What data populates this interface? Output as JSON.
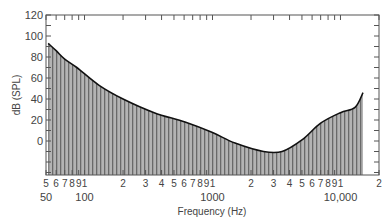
{
  "chart_data": {
    "type": "area",
    "title": "",
    "xlabel": "Frequency (Hz)",
    "ylabel": "dB (SPL)",
    "xscale": "log",
    "xlim": [
      50,
      20000
    ],
    "ylim": [
      -32,
      120
    ],
    "grid": false,
    "legend": null,
    "y_ticks": [
      0,
      20,
      40,
      60,
      80,
      100,
      120
    ],
    "y_minor_ticks": [
      -30,
      -20,
      -10,
      10,
      30,
      50,
      70,
      90,
      110
    ],
    "x_minor_tick_labels": [
      {
        "f": 50,
        "label": "5"
      },
      {
        "f": 60,
        "label": "6"
      },
      {
        "f": 70,
        "label": "7"
      },
      {
        "f": 80,
        "label": "8"
      },
      {
        "f": 90,
        "label": "9"
      },
      {
        "f": 100,
        "label": "1"
      },
      {
        "f": 200,
        "label": "2"
      },
      {
        "f": 300,
        "label": "3"
      },
      {
        "f": 400,
        "label": "4"
      },
      {
        "f": 500,
        "label": "5"
      },
      {
        "f": 600,
        "label": "6"
      },
      {
        "f": 700,
        "label": "7"
      },
      {
        "f": 800,
        "label": "8"
      },
      {
        "f": 900,
        "label": "9"
      },
      {
        "f": 1000,
        "label": "1"
      },
      {
        "f": 2000,
        "label": "2"
      },
      {
        "f": 3000,
        "label": "3"
      },
      {
        "f": 4000,
        "label": "4"
      },
      {
        "f": 5000,
        "label": "5"
      },
      {
        "f": 6000,
        "label": "6"
      },
      {
        "f": 7000,
        "label": "7"
      },
      {
        "f": 8000,
        "label": "8"
      },
      {
        "f": 9000,
        "label": "9"
      },
      {
        "f": 10000,
        "label": "1"
      },
      {
        "f": 20000,
        "label": "2"
      }
    ],
    "x_major_labels": [
      {
        "f": 50,
        "label": "50"
      },
      {
        "f": 100,
        "label": "100"
      },
      {
        "f": 1000,
        "label": "1000"
      },
      {
        "f": 10000,
        "label": "10,000"
      }
    ],
    "series": [
      {
        "name": "Threshold curve",
        "x": [
          52,
          60,
          70,
          87,
          130,
          200,
          350,
          610,
          1000,
          1500,
          2500,
          3500,
          5000,
          7000,
          10000,
          13000,
          15000
        ],
        "y": [
          93,
          86,
          78,
          70,
          53,
          40,
          27,
          18,
          8,
          -2,
          -10,
          -10,
          1,
          17,
          27,
          32,
          46
        ]
      }
    ],
    "colors": {
      "fill": "#9a9a9a",
      "stripe": "#6a6a6a",
      "line": "#111111",
      "axis": "#555555"
    }
  }
}
